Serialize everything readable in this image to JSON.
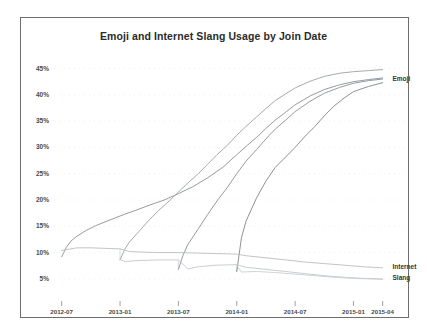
{
  "chart_data": {
    "type": "line",
    "title": "Emoji and Internet Slang Usage by Join Date",
    "xlabel": "",
    "ylabel": "",
    "grid": true,
    "legend_position": "right-inline",
    "ylim": [
      2.5,
      47
    ],
    "ytick_labels": [
      "45%",
      "40%",
      "35%",
      "30%",
      "25%",
      "20%",
      "15%",
      "10%",
      "5%"
    ],
    "ytick_values": [
      45,
      40,
      35,
      30,
      25,
      20,
      15,
      10,
      5
    ],
    "xtick_labels": [
      "2012-07",
      "2013-01",
      "2013-07",
      "2014-01",
      "2014-07",
      "2015-01",
      "2015-04"
    ],
    "xtick_values": [
      2012.5,
      2013.0,
      2013.5,
      2014.0,
      2014.5,
      2015.0,
      2015.25
    ],
    "xlim": [
      2012.46,
      2015.33
    ],
    "annotations": [
      {
        "text": "Emoji",
        "x": 2015.3,
        "y": 43.0
      },
      {
        "text": "Internet",
        "x": 2015.3,
        "y": 7.2
      },
      {
        "text": "Slang",
        "x": 2015.3,
        "y": 5.2
      }
    ],
    "series": [
      {
        "name": "Emoji cohort 2012-07",
        "group": "Emoji",
        "color": "#8a8f96",
        "x": [
          2012.5,
          2012.54,
          2012.58,
          2012.63,
          2012.71,
          2012.79,
          2012.88,
          2012.96,
          2013.04,
          2013.13,
          2013.25,
          2013.38,
          2013.5,
          2013.63,
          2013.75,
          2013.88,
          2014.0,
          2014.08,
          2014.17,
          2014.25,
          2014.33,
          2014.42,
          2014.5,
          2014.63,
          2014.75,
          2014.88,
          2015.0,
          2015.13,
          2015.25
        ],
        "y": [
          9.2,
          11.0,
          12.2,
          13.1,
          14.2,
          15.1,
          15.9,
          16.6,
          17.3,
          18.0,
          19.0,
          20.0,
          21.2,
          22.6,
          24.2,
          26.2,
          28.6,
          30.2,
          31.9,
          33.6,
          35.2,
          36.7,
          38.1,
          39.8,
          41.0,
          41.9,
          42.5,
          42.9,
          43.2
        ]
      },
      {
        "name": "Emoji cohort 2013-01",
        "group": "Emoji",
        "color": "#9aa0a6",
        "x": [
          2013.0,
          2013.04,
          2013.08,
          2013.17,
          2013.25,
          2013.33,
          2013.42,
          2013.5,
          2013.58,
          2013.67,
          2013.75,
          2013.83,
          2013.92,
          2014.0,
          2014.08,
          2014.17,
          2014.25,
          2014.33,
          2014.42,
          2014.5,
          2014.63,
          2014.75,
          2014.88,
          2015.0,
          2015.13,
          2015.25
        ],
        "y": [
          8.6,
          10.6,
          12.0,
          14.2,
          16.2,
          18.0,
          19.8,
          21.5,
          23.2,
          25.0,
          26.8,
          28.6,
          30.4,
          32.3,
          34.0,
          35.8,
          37.4,
          38.9,
          40.2,
          41.3,
          42.6,
          43.5,
          44.1,
          44.4,
          44.6,
          44.8
        ]
      },
      {
        "name": "Emoji cohort 2013-07",
        "group": "Emoji",
        "color": "#8a8f96",
        "x": [
          2013.5,
          2013.54,
          2013.58,
          2013.67,
          2013.75,
          2013.83,
          2013.92,
          2014.0,
          2014.08,
          2014.17,
          2014.25,
          2014.33,
          2014.42,
          2014.5,
          2014.63,
          2014.75,
          2014.88,
          2015.0,
          2015.13,
          2015.25
        ],
        "y": [
          6.8,
          9.5,
          11.5,
          14.5,
          17.2,
          19.8,
          22.4,
          25.0,
          27.4,
          29.6,
          31.6,
          33.5,
          35.2,
          36.8,
          38.8,
          40.3,
          41.4,
          42.2,
          42.7,
          43.0
        ]
      },
      {
        "name": "Emoji cohort 2014-01",
        "group": "Emoji",
        "color": "#7f858c",
        "x": [
          2014.0,
          2014.04,
          2014.08,
          2014.17,
          2014.25,
          2014.33,
          2014.42,
          2014.5,
          2014.58,
          2014.67,
          2014.75,
          2014.83,
          2014.92,
          2015.0,
          2015.13,
          2015.25
        ],
        "y": [
          6.4,
          12.8,
          16.0,
          20.4,
          23.6,
          26.2,
          28.2,
          30.0,
          32.0,
          34.0,
          36.0,
          37.8,
          39.4,
          40.6,
          41.6,
          42.3
        ]
      },
      {
        "name": "Internet",
        "group": "Internet",
        "color": "#b9bdc2",
        "x": [
          2012.5,
          2012.63,
          2012.75,
          2012.88,
          2013.0,
          2013.08,
          2013.17,
          2013.33,
          2013.5,
          2013.67,
          2013.83,
          2014.0,
          2014.08,
          2014.25,
          2014.42,
          2014.58,
          2014.75,
          2014.92,
          2015.08,
          2015.25
        ],
        "y": [
          10.4,
          10.9,
          10.9,
          10.8,
          10.7,
          10.2,
          10.1,
          10.0,
          10.0,
          9.9,
          9.8,
          9.7,
          9.4,
          9.0,
          8.6,
          8.2,
          7.9,
          7.6,
          7.3,
          7.1
        ]
      },
      {
        "name": "Slang",
        "group": "Slang",
        "color": "#c3c7cb",
        "x": [
          2013.0,
          2013.04,
          2013.17,
          2013.33,
          2013.5,
          2013.58,
          2013.67,
          2013.83,
          2014.0,
          2014.08,
          2014.25,
          2014.42,
          2014.58,
          2014.75,
          2014.92,
          2015.08,
          2015.25
        ],
        "y": [
          8.7,
          8.3,
          8.5,
          8.6,
          8.6,
          6.9,
          7.3,
          7.6,
          7.7,
          7.2,
          6.8,
          6.4,
          6.0,
          5.6,
          5.3,
          5.1,
          5.0
        ]
      },
      {
        "name": "Slang lower",
        "group": "Slang",
        "color": "#cacdd1",
        "x": [
          2014.0,
          2014.04,
          2014.17,
          2014.33,
          2014.5,
          2014.67,
          2014.83,
          2015.0,
          2015.13,
          2015.25
        ],
        "y": [
          7.6,
          6.3,
          6.4,
          6.2,
          5.9,
          5.6,
          5.3,
          5.1,
          5.0,
          4.9
        ]
      }
    ],
    "drops": [
      {
        "x": 2013.0,
        "y_from": 10.7,
        "y_to": 8.6
      },
      {
        "x": 2013.5,
        "y_from": 8.6,
        "y_to": 6.8
      },
      {
        "x": 2014.0,
        "y_from": 7.7,
        "y_to": 6.3
      }
    ]
  },
  "axes": {
    "plot_left_px": 57,
    "plot_right_px": 392,
    "plot_top_px": 58,
    "plot_bottom_px": 292
  }
}
